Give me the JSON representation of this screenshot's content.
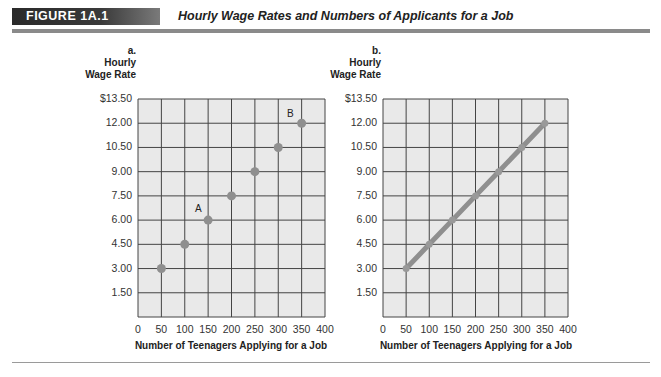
{
  "figure": {
    "label": "FIGURE 1A.1",
    "title": "Hourly Wage Rates and Numbers of Applicants for a Job"
  },
  "colors": {
    "plot_bg": "#e9e9e9",
    "grid": "#444444",
    "marker": "#8f8f8f",
    "line": "#8f8f8f",
    "rule": "#8a8a8a"
  },
  "chart_data": [
    {
      "type": "scatter",
      "panel": "a.",
      "title": "",
      "ylabel": "Hourly Wage Rate",
      "xlabel": "Number of Teenagers Applying for a Job",
      "x": [
        50,
        100,
        150,
        200,
        250,
        300,
        350
      ],
      "y": [
        3.0,
        4.5,
        6.0,
        7.5,
        9.0,
        10.5,
        12.0
      ],
      "annotations": [
        {
          "text": "A",
          "x": 150,
          "y": 6.0
        },
        {
          "text": "B",
          "x": 350,
          "y": 12.0
        }
      ],
      "xlim": [
        0,
        400
      ],
      "ylim": [
        0,
        13.5
      ],
      "xticks": [
        "0",
        "50",
        "100",
        "150",
        "200",
        "250",
        "300",
        "350",
        "400"
      ],
      "yticks": [
        "1.50",
        "3.00",
        "4.50",
        "6.00",
        "7.50",
        "9.00",
        "10.50",
        "12.00",
        "$13.50"
      ],
      "grid": true
    },
    {
      "type": "line",
      "panel": "b.",
      "title": "",
      "ylabel": "Hourly Wage Rate",
      "xlabel": "Number of Teenagers Applying for a Job",
      "x": [
        50,
        100,
        150,
        200,
        250,
        300,
        350
      ],
      "y": [
        3.0,
        4.5,
        6.0,
        7.5,
        9.0,
        10.5,
        12.0
      ],
      "xlim": [
        0,
        400
      ],
      "ylim": [
        0,
        13.5
      ],
      "xticks": [
        "0",
        "50",
        "100",
        "150",
        "200",
        "250",
        "300",
        "350",
        "400"
      ],
      "yticks": [
        "1.50",
        "3.00",
        "4.50",
        "6.00",
        "7.50",
        "9.00",
        "10.50",
        "12.00",
        "$13.50"
      ],
      "grid": true
    }
  ],
  "panels": [
    {
      "letter": "a.",
      "ylabel_line1": "Hourly",
      "ylabel_line2": "Wage Rate",
      "xlabel": "Number of Teenagers Applying for a Job"
    },
    {
      "letter": "b.",
      "ylabel_line1": "Hourly",
      "ylabel_line2": "Wage Rate",
      "xlabel": "Number of Teenagers Applying for a Job"
    }
  ]
}
